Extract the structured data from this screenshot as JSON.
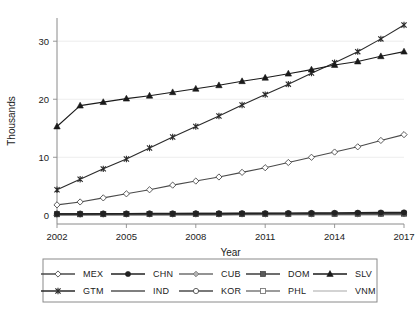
{
  "chart_data": {
    "type": "line",
    "title": "",
    "xlabel": "Year",
    "ylabel": "Thousands",
    "xlim": [
      2002,
      2017
    ],
    "ylim": [
      -1.5,
      34
    ],
    "grid": true,
    "legend_position": "bottom",
    "x": [
      2002,
      2003,
      2004,
      2005,
      2006,
      2007,
      2008,
      2009,
      2010,
      2011,
      2012,
      2013,
      2014,
      2015,
      2016,
      2017
    ],
    "xticks": [
      2002,
      2005,
      2008,
      2011,
      2014,
      2017
    ],
    "xtick_labels": [
      "2002",
      "2005",
      "2008",
      "2011",
      "2014",
      "2017"
    ],
    "yticks": [
      0,
      10,
      20,
      30
    ],
    "ytick_labels": [
      "0",
      "10",
      "20",
      "30"
    ],
    "series": [
      {
        "name": "MEX",
        "marker": "open-diamond",
        "color": "#4a4a4a",
        "values": [
          1.8,
          2.3,
          3.0,
          3.7,
          4.4,
          5.2,
          5.9,
          6.6,
          7.4,
          8.2,
          9.1,
          10.0,
          10.9,
          11.8,
          12.9,
          13.9
        ]
      },
      {
        "name": "CHN",
        "marker": "filled-circle",
        "color": "#222222",
        "values": [
          0.25,
          0.25,
          0.28,
          0.28,
          0.3,
          0.3,
          0.32,
          0.32,
          0.35,
          0.35,
          0.38,
          0.4,
          0.42,
          0.45,
          0.48,
          0.5
        ]
      },
      {
        "name": "CUB",
        "marker": "shaded-diamond",
        "color": "#6f6f6f",
        "values": [
          0.12,
          0.12,
          0.13,
          0.13,
          0.14,
          0.14,
          0.15,
          0.15,
          0.16,
          0.16,
          0.17,
          0.18,
          0.18,
          0.19,
          0.2,
          0.2
        ]
      },
      {
        "name": "DOM",
        "marker": "filled-square",
        "color": "#3d3d3d",
        "values": [
          0.18,
          0.18,
          0.19,
          0.2,
          0.2,
          0.21,
          0.22,
          0.22,
          0.23,
          0.24,
          0.25,
          0.26,
          0.27,
          0.28,
          0.29,
          0.3
        ]
      },
      {
        "name": "SLV",
        "marker": "filled-triangle",
        "color": "#1a1a1a",
        "values": [
          15.3,
          18.9,
          19.5,
          20.1,
          20.6,
          21.2,
          21.8,
          22.4,
          23.1,
          23.7,
          24.4,
          25.1,
          25.9,
          26.5,
          27.4,
          28.2
        ]
      },
      {
        "name": "GTM",
        "marker": "star",
        "color": "#2a2a2a",
        "values": [
          4.4,
          6.2,
          8.0,
          9.7,
          11.6,
          13.5,
          15.3,
          17.1,
          19.0,
          20.8,
          22.6,
          24.5,
          26.3,
          28.2,
          30.4,
          32.8
        ]
      },
      {
        "name": "IND",
        "marker": "none",
        "color": "#555555",
        "values": [
          0.06,
          0.06,
          0.07,
          0.07,
          0.07,
          0.08,
          0.08,
          0.08,
          0.09,
          0.09,
          0.1,
          0.1,
          0.1,
          0.11,
          0.11,
          0.12
        ]
      },
      {
        "name": "KOR",
        "marker": "open-circle",
        "color": "#4d4d4d",
        "values": [
          0.3,
          0.3,
          0.31,
          0.31,
          0.32,
          0.32,
          0.33,
          0.33,
          0.34,
          0.34,
          0.35,
          0.35,
          0.36,
          0.36,
          0.37,
          0.38
        ]
      },
      {
        "name": "PHL",
        "marker": "open-square",
        "color": "#7a7a7a",
        "values": [
          0.2,
          0.2,
          0.21,
          0.21,
          0.22,
          0.22,
          0.23,
          0.23,
          0.24,
          0.24,
          0.25,
          0.26,
          0.26,
          0.27,
          0.28,
          0.28
        ]
      },
      {
        "name": "VNM",
        "marker": "light-line",
        "color": "#9b9b9b",
        "values": [
          0.1,
          0.1,
          0.11,
          0.11,
          0.12,
          0.12,
          0.13,
          0.13,
          0.14,
          0.14,
          0.15,
          0.15,
          0.16,
          0.16,
          0.17,
          0.17
        ]
      }
    ],
    "legend_rows": [
      [
        "MEX",
        "CHN",
        "CUB",
        "DOM",
        "SLV"
      ],
      [
        "GTM",
        "IND",
        "KOR",
        "PHL",
        "VNM"
      ]
    ]
  }
}
